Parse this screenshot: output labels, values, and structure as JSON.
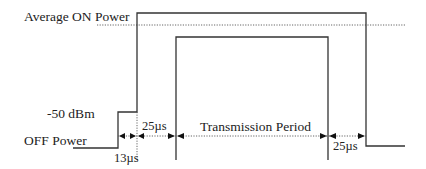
{
  "diagram": {
    "type": "power-vs-time timing mask",
    "labels": {
      "average_on_power": "Average ON Power",
      "minus_50_dbm": "-50 dBm",
      "off_power": "OFF Power",
      "ramp_up_13": "13µs",
      "settle_25_left": "25µs",
      "transmission_period": "Transmission Period",
      "settle_25_right": "25µs"
    },
    "colors": {
      "line": "#333333",
      "text": "#222222",
      "background": "#ffffff"
    }
  }
}
